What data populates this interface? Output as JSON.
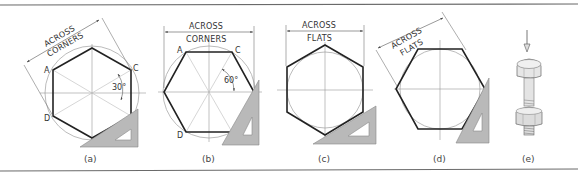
{
  "figure": {
    "panels": [
      {
        "id": "a",
        "caption": "(a)",
        "dimension_label_line1": "ACROSS",
        "dimension_label_line2": "CORNERS",
        "angle_label": "30°",
        "points": {
          "A": "A",
          "B": "B",
          "C": "C",
          "D": "D"
        }
      },
      {
        "id": "b",
        "caption": "(b)",
        "dimension_label_line1": "ACROSS",
        "dimension_label_line2": "CORNERS",
        "angle_label": "60°",
        "points": {
          "A": "A",
          "B": "B",
          "C": "C",
          "D": "D"
        }
      },
      {
        "id": "c",
        "caption": "(c)",
        "dimension_label_line1": "ACROSS",
        "dimension_label_line2": "FLATS"
      },
      {
        "id": "d",
        "caption": "(d)",
        "dimension_label_line1": "ACROSS",
        "dimension_label_line2": "FLATS"
      },
      {
        "id": "e",
        "caption": "(e)",
        "illustration": "hex-bolt-with-nut"
      }
    ],
    "colors": {
      "outline": "#222222",
      "construction": "#aaaaaa",
      "triangle_fill": "#b9b9b9",
      "frame": "#6a6a6a"
    }
  }
}
